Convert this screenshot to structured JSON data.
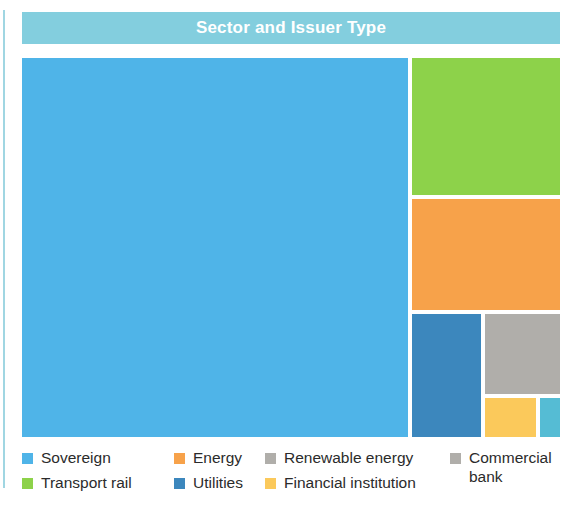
{
  "header": {
    "title": "Sector and Issuer Type",
    "bar_color": "#83cede",
    "title_color": "#ffffff"
  },
  "legend": {
    "columns": [
      {
        "items": [
          {
            "label": "Sovereign",
            "color": "#4fb4e8",
            "swatch_name": "legend-swatch-sovereign"
          },
          {
            "label": "Transport rail",
            "color": "#8dd24a",
            "swatch_name": "legend-swatch-transport-rail"
          }
        ]
      },
      {
        "items": [
          {
            "label": "Energy",
            "color": "#f7a24a",
            "swatch_name": "legend-swatch-energy"
          },
          {
            "label": "Utilities",
            "color": "#3c87bd",
            "swatch_name": "legend-swatch-utilities"
          }
        ]
      },
      {
        "items": [
          {
            "label": "Renewable energy",
            "color": "#b0aeaa",
            "swatch_name": "legend-swatch-renewable-energy"
          },
          {
            "label": "Financial institution",
            "color": "#fbc95b",
            "swatch_name": "legend-swatch-financial-institution"
          }
        ]
      },
      {
        "items": [
          {
            "label": "Commercial\nbank",
            "color": "#b0aeaa",
            "swatch_name": "legend-swatch-commercial-bank"
          }
        ]
      }
    ]
  },
  "chart_data": {
    "type": "treemap",
    "title": "Sector and Issuer Type",
    "xlabel": "",
    "ylabel": "",
    "grid": false,
    "legend_position": "bottom",
    "value_unit": "share of total (percent, estimated from tile area)",
    "categories": [
      "Sovereign",
      "Transport rail",
      "Energy",
      "Utilities",
      "Renewable energy",
      "Financial institution",
      "Commercial bank"
    ],
    "values": [
      72.4,
      10.1,
      8.1,
      4.2,
      3.0,
      1.0,
      0.4
    ],
    "colors": [
      "#4fb4e8",
      "#8dd24a",
      "#f7a24a",
      "#3c87bd",
      "#b0aeaa",
      "#fbc95b",
      "#55bcd4"
    ],
    "tiles": [
      {
        "name": "Sovereign",
        "color": "#4fb4e8",
        "value": 72.4,
        "x": 0,
        "y": 0,
        "w": 386,
        "h": 379
      },
      {
        "name": "Transport rail",
        "color": "#8dd24a",
        "value": 10.1,
        "x": 390,
        "y": 0,
        "w": 148,
        "h": 137
      },
      {
        "name": "Energy",
        "color": "#f7a24a",
        "value": 8.1,
        "x": 390,
        "y": 141,
        "w": 148,
        "h": 111
      },
      {
        "name": "Utilities",
        "color": "#3c87bd",
        "value": 4.2,
        "x": 390,
        "y": 256,
        "w": 69,
        "h": 123
      },
      {
        "name": "Renewable energy",
        "color": "#b0aeaa",
        "value": 3.0,
        "x": 463,
        "y": 256,
        "w": 75,
        "h": 80
      },
      {
        "name": "Financial institution",
        "color": "#fbc95b",
        "value": 1.0,
        "x": 463,
        "y": 340,
        "w": 51,
        "h": 39
      },
      {
        "name": "Commercial bank",
        "color": "#55bcd4",
        "value": 0.4,
        "x": 518,
        "y": 340,
        "w": 20,
        "h": 39
      }
    ]
  }
}
